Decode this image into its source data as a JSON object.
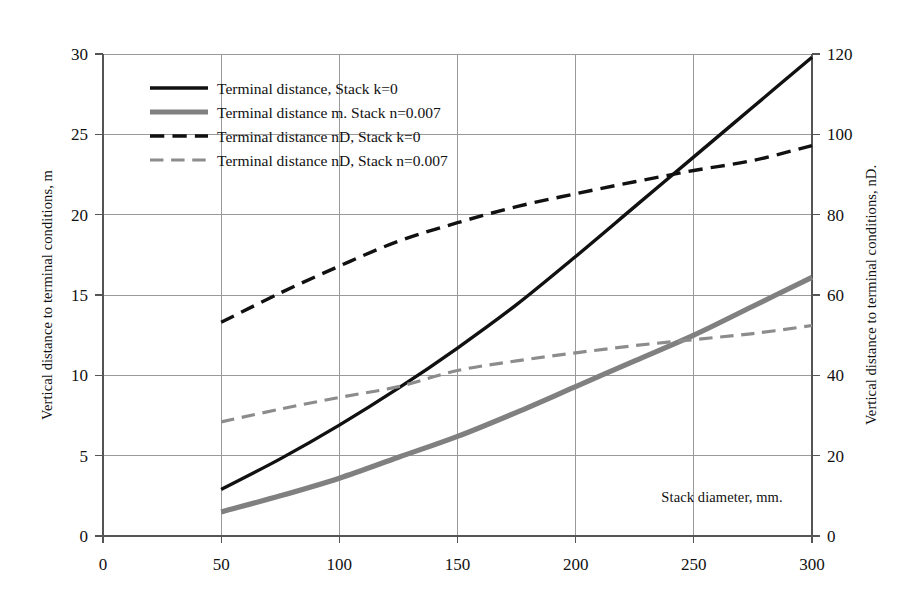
{
  "chart_data": {
    "type": "line",
    "title": "",
    "xlabel": "Stack diameter, mm.",
    "ylabel": "Vertical distance to terminal conditions, m",
    "y2label": "Vertical distance to terminal conditions, nD.",
    "xlim": [
      0,
      300
    ],
    "ylim": [
      0,
      30
    ],
    "y2lim": [
      0,
      120
    ],
    "xticks": [
      "0",
      "50",
      "100",
      "150",
      "200",
      "250",
      "300"
    ],
    "xtick_values": [
      0,
      50,
      100,
      150,
      200,
      250,
      300
    ],
    "yticks": [
      "0",
      "5",
      "10",
      "15",
      "20",
      "25",
      "30"
    ],
    "ytick_values": [
      0,
      5,
      10,
      15,
      20,
      25,
      30
    ],
    "y2ticks": [
      "0",
      "20",
      "40",
      "60",
      "80",
      "100",
      "120"
    ],
    "y2tick_values": [
      0,
      20,
      40,
      60,
      80,
      100,
      120
    ],
    "grid": true,
    "legend_position": "upper-left-inside",
    "x": [
      50,
      75,
      100,
      125,
      150,
      175,
      200,
      225,
      250,
      275,
      300
    ],
    "series": [
      {
        "name": "Terminal distance, Stack k=0",
        "axis": "left",
        "color": "#111111",
        "style": "solid",
        "width": 3.4,
        "values": [
          2.9,
          4.8,
          6.9,
          9.2,
          11.7,
          14.4,
          17.4,
          20.5,
          23.6,
          26.7,
          29.8
        ]
      },
      {
        "name": "Terminal distance m. Stack n=0.007",
        "axis": "left",
        "color": "#808080",
        "style": "solid",
        "width": 5.2,
        "values": [
          1.5,
          2.5,
          3.6,
          4.9,
          6.2,
          7.7,
          9.3,
          10.9,
          12.5,
          14.3,
          16.1
        ]
      },
      {
        "name": "Terminal distance nD, Stack k=0",
        "axis": "right",
        "color": "#111111",
        "style": "dashed",
        "width": 3.4,
        "values": [
          53.2,
          60.5,
          67.2,
          73.4,
          78.0,
          82.0,
          85.2,
          88.2,
          91.0,
          93.5,
          97.2
        ]
      },
      {
        "name": "Terminal distance nD, Stack n=0.007",
        "axis": "right",
        "color": "#8c8c8c",
        "style": "dashed",
        "width": 3.2,
        "values": [
          28.4,
          31.6,
          34.5,
          37.2,
          41.2,
          43.6,
          45.6,
          47.4,
          48.9,
          50.4,
          52.4
        ]
      }
    ]
  },
  "legend": {
    "items": [
      {
        "label": "Terminal distance, Stack k=0"
      },
      {
        "label": "Terminal distance m. Stack n=0.007"
      },
      {
        "label": "Terminal distance nD, Stack k=0"
      },
      {
        "label": "Terminal distance nD, Stack n=0.007"
      }
    ]
  }
}
